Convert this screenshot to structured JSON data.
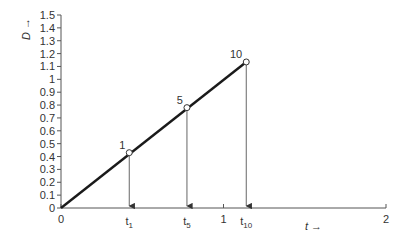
{
  "chart_data": {
    "type": "line",
    "title": "",
    "xlabel": "t →",
    "ylabel": "D →",
    "xlim": [
      0,
      2
    ],
    "ylim": [
      0,
      1.5
    ],
    "grid": false,
    "x_ticks": [
      0,
      1,
      2
    ],
    "x_tick_labels": [
      "0",
      "1",
      "2"
    ],
    "y_ticks": [
      0,
      0.1,
      0.2,
      0.3,
      0.4,
      0.5,
      0.6,
      0.7,
      0.8,
      0.9,
      1,
      1.1,
      1.2,
      1.3,
      1.4,
      1.5
    ],
    "y_tick_labels": [
      "0",
      "0.1",
      "0.2",
      "0.3",
      "0.4",
      "0.5",
      "0.6",
      "0.7",
      "0.8",
      "0.9",
      "1",
      "1.1",
      "1.2",
      "1.3",
      "1.4",
      "1.5"
    ],
    "series": [
      {
        "name": "D(t)",
        "x": [
          0,
          1.14
        ],
        "y": [
          0,
          1.135
        ],
        "color": "#1a1a1a"
      }
    ],
    "marked_points": [
      {
        "label": "1",
        "t": 0.42,
        "D": 0.43,
        "t_label": "t",
        "t_sub": "1"
      },
      {
        "label": "5",
        "t": 0.775,
        "D": 0.78,
        "t_label": "t",
        "t_sub": "5"
      },
      {
        "label": "10",
        "t": 1.14,
        "D": 1.135,
        "t_label": "t",
        "t_sub": "10"
      }
    ],
    "legend": null
  }
}
